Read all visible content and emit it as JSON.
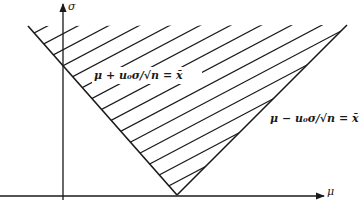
{
  "diagram": {
    "type": "confidence-region",
    "axes": {
      "x_label": "μ",
      "y_label": "σ"
    },
    "lines": {
      "left": "μ + u₀σ/√n = x̄",
      "right": "μ − u₀σ/√n = x̄"
    },
    "region": "hatched area between the two lines above the vertex",
    "colors": {
      "ink": "#1a1a1a",
      "background": "#ffffff"
    }
  }
}
